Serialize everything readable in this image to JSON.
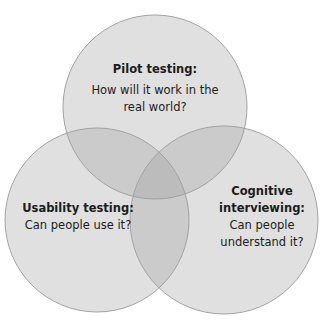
{
  "diagram": {
    "type": "venn",
    "colors": {
      "background": "#ffffff",
      "circle_fill": "rgba(160,160,160,0.32)",
      "circle_stroke": "#a3a3a3",
      "text": "#1c1c1c"
    },
    "circles": [
      {
        "id": "pilot",
        "title": "Pilot testing:",
        "desc_lines": [
          "How will it work in the",
          "real world?"
        ]
      },
      {
        "id": "usability",
        "title": "Usability testing:",
        "desc_lines": [
          "Can people use it?"
        ]
      },
      {
        "id": "cognitive",
        "title_lines": [
          "Cognitive",
          "interviewing:"
        ],
        "desc_lines": [
          "Can people",
          "understand it?"
        ]
      }
    ]
  }
}
